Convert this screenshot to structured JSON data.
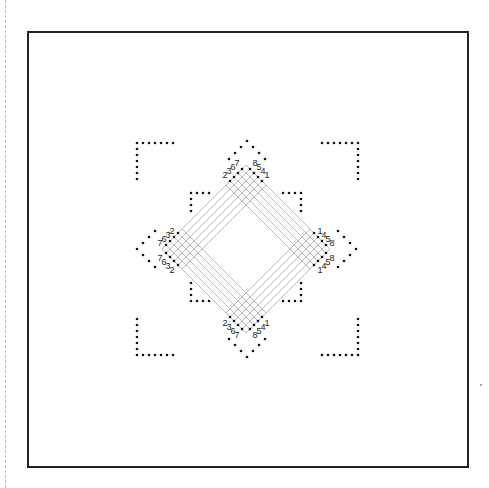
{
  "diagram": {
    "title": "",
    "colors": {
      "frame": "#222222",
      "dot": "#111111",
      "mesh_line": "#aaaaaa",
      "label": "#222222",
      "guide": "#b8b8b8"
    },
    "frame": {
      "x": 27,
      "y": 31,
      "w": 442,
      "h": 437
    },
    "center": {
      "x": 246,
      "y": 249
    },
    "outer_corners": [
      {
        "name": "top-left",
        "dots": 13
      },
      {
        "name": "top-right",
        "dots": 13
      },
      {
        "name": "bottom-left",
        "dots": 13
      },
      {
        "name": "bottom-right",
        "dots": 13
      }
    ],
    "outer_chevrons": [
      {
        "name": "top",
        "dots": 7
      },
      {
        "name": "left",
        "dots": 7
      },
      {
        "name": "right",
        "dots": 7
      },
      {
        "name": "bottom",
        "dots": 7
      }
    ],
    "inner_corners": [
      {
        "name": "top-left",
        "dots": 7
      },
      {
        "name": "top-right",
        "dots": 7
      },
      {
        "name": "bottom-left",
        "dots": 7
      },
      {
        "name": "bottom-right",
        "dots": 7
      }
    ],
    "port_labels": {
      "top": [
        "2",
        "3",
        "6",
        "7",
        "8",
        "5",
        "4",
        "1"
      ],
      "left": [
        "2",
        "3",
        "6",
        "7",
        "7",
        "6",
        "3",
        "2"
      ],
      "right": [
        "1",
        "4",
        "5",
        "8",
        "8",
        "5",
        "4",
        "1"
      ],
      "bottom": [
        "2",
        "3",
        "6",
        "7",
        "8",
        "5",
        "4",
        "1"
      ]
    },
    "stray_dot": {
      "x": 481,
      "y": 385
    }
  }
}
